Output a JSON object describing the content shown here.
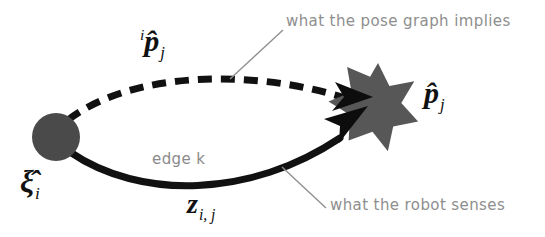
{
  "figure": {
    "background_color": "#ffffff",
    "nodes": [
      {
        "name": "pose-node",
        "shape": "circle",
        "cx": 56,
        "cy": 137,
        "r": 24,
        "color": "#4a4a4a",
        "label": "ξ̂",
        "label_sub": "i"
      },
      {
        "name": "landmark-star",
        "shape": "star-7",
        "cx": 378,
        "cy": 97,
        "r_outer": 34,
        "r_inner": 14,
        "points": 7,
        "color": "#575757",
        "label": "p̂",
        "label_sub": "j"
      }
    ],
    "edges": [
      {
        "name": "implied-edge",
        "style": "dashed",
        "color": "#111111",
        "label_sup": "i",
        "label_base": "p̂",
        "label_sub": "j"
      },
      {
        "name": "measured-edge",
        "style": "solid",
        "color": "#111111",
        "label_base": "z",
        "label_sub": "i, j",
        "edge_caption": "edge k"
      }
    ]
  },
  "labels": {
    "phat_implied": {
      "sup": "i",
      "base": "p̂",
      "sub": "j"
    },
    "phat_sensed": {
      "base": "p̂",
      "sub": "j"
    },
    "xi_i": {
      "base": "ξ̂",
      "sub": "i"
    },
    "z_ij": {
      "base": "z",
      "sub": "i, j"
    }
  },
  "annotations": {
    "pose_graph_note": "what the pose graph implies",
    "robot_senses_note": "what the robot senses",
    "edge_note": "edge k"
  },
  "colors": {
    "node_gray": "#4a4a4a",
    "star_gray": "#575757",
    "stroke_black": "#111111",
    "annotation_gray": "#8e8e8e",
    "leader_gray": "#909090",
    "background": "#ffffff"
  }
}
